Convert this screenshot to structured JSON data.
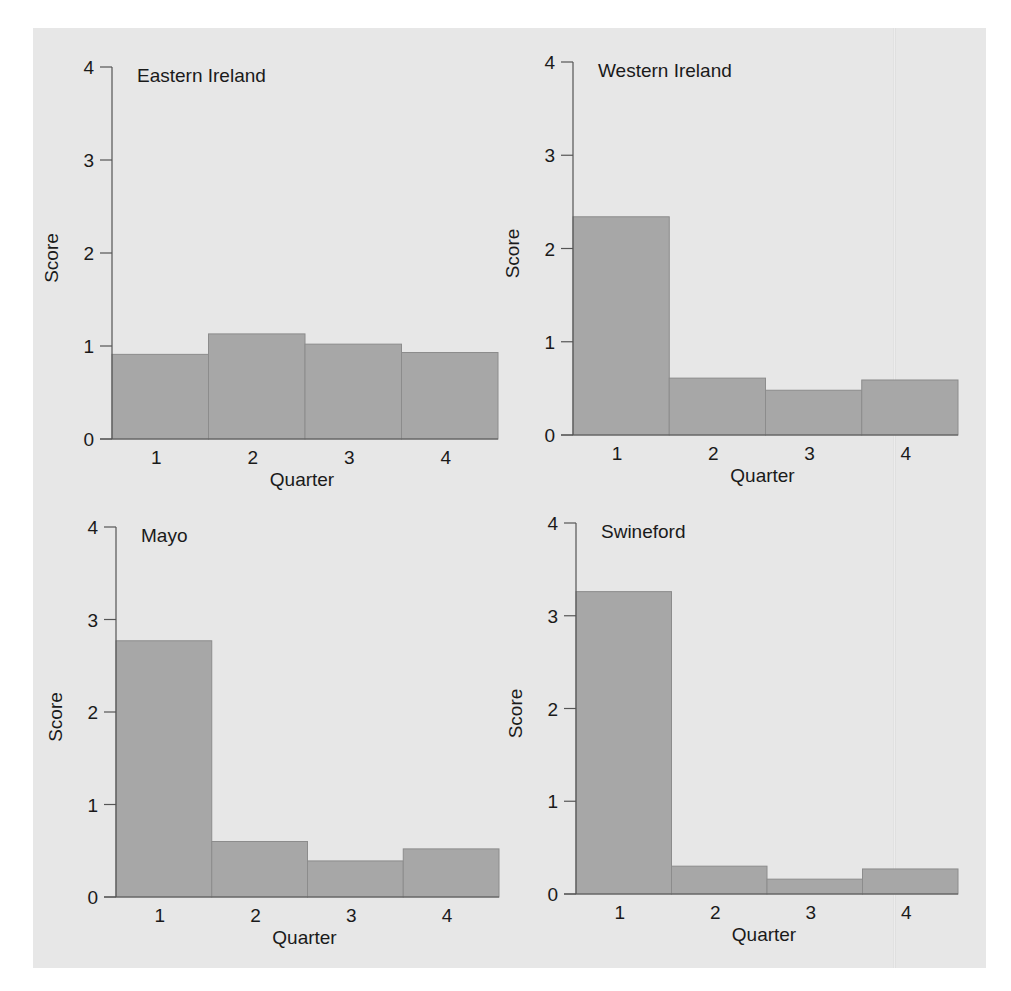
{
  "chart_data": [
    {
      "type": "bar",
      "title": "Eastern Ireland",
      "xlabel": "Quarter",
      "ylabel": "Score",
      "categories": [
        "1",
        "2",
        "3",
        "4"
      ],
      "values": [
        0.91,
        1.13,
        1.02,
        0.93
      ],
      "yticks": [
        "0",
        "1",
        "2",
        "3",
        "4"
      ],
      "ylim": [
        0,
        4
      ],
      "grid": false
    },
    {
      "type": "bar",
      "title": "Western Ireland",
      "xlabel": "Quarter",
      "ylabel": "Score",
      "categories": [
        "1",
        "2",
        "3",
        "4"
      ],
      "values": [
        2.34,
        0.61,
        0.48,
        0.59
      ],
      "yticks": [
        "0",
        "1",
        "2",
        "3",
        "4"
      ],
      "ylim": [
        0,
        4
      ],
      "grid": false
    },
    {
      "type": "bar",
      "title": "Mayo",
      "xlabel": "Quarter",
      "ylabel": "Score",
      "categories": [
        "1",
        "2",
        "3",
        "4"
      ],
      "values": [
        2.77,
        0.6,
        0.39,
        0.52
      ],
      "yticks": [
        "0",
        "1",
        "2",
        "3",
        "4"
      ],
      "ylim": [
        0,
        4
      ],
      "grid": false
    },
    {
      "type": "bar",
      "title": "Swineford",
      "xlabel": "Quarter",
      "ylabel": "Score",
      "categories": [
        "1",
        "2",
        "3",
        "4"
      ],
      "values": [
        3.26,
        0.3,
        0.16,
        0.27
      ],
      "yticks": [
        "0",
        "1",
        "2",
        "3",
        "4"
      ],
      "ylim": [
        0,
        4
      ],
      "grid": false
    }
  ],
  "colors": {
    "bar_fill": "#a7a7a7",
    "bar_edge": "#8c8c8c",
    "background": "#e7e7e7"
  }
}
